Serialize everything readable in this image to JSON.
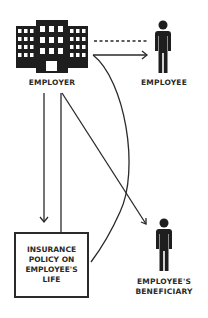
{
  "diagram": {
    "nodes": {
      "employer": {
        "label": "EMPLOYER",
        "icon": "building-icon"
      },
      "employee": {
        "label": "EMPLOYEE",
        "icon": "person-icon"
      },
      "policy": {
        "label": "INSURANCE\nPOLICY ON\nEMPLOYEE'S\nLIFE"
      },
      "beneficiary": {
        "label": "EMPLOYEE'S\nBENEFICIARY",
        "icon": "person-icon"
      }
    },
    "edges": [
      {
        "from": "employer",
        "to": "employee",
        "style": "dotted"
      },
      {
        "from": "employer",
        "to": "employee",
        "style": "arrow"
      },
      {
        "from": "employer",
        "to": "policy",
        "style": "arrow"
      },
      {
        "from": "employer",
        "to": "policy",
        "style": "line"
      },
      {
        "from": "employer",
        "to": "beneficiary",
        "style": "arrow"
      },
      {
        "from": "employer",
        "to": "policy",
        "style": "curve"
      }
    ],
    "colors": {
      "ink": "#2a2a2a",
      "background": "#ffffff"
    }
  }
}
